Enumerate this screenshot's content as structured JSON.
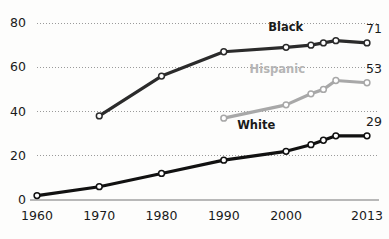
{
  "chart_data": {
    "type": "line",
    "title": "",
    "subtitle": "",
    "xlabel": "",
    "ylabel": "",
    "xlim": [
      1960,
      2013
    ],
    "ylim": [
      0,
      80
    ],
    "grid": true,
    "grid_axis": "y",
    "legend_position": "inline-series-labels",
    "x_ticks": [
      "1960",
      "1970",
      "1980",
      "1990",
      "2000",
      "2013"
    ],
    "x_tick_values": [
      1960,
      1970,
      1980,
      1990,
      2000,
      2013
    ],
    "y_ticks": [
      "0",
      "20",
      "40",
      "60",
      "80"
    ],
    "y_tick_values": [
      0,
      20,
      40,
      60,
      80
    ],
    "series": [
      {
        "name": "Black",
        "color": "#2b2b2b",
        "label_color": "#1a1a1a",
        "end_label": "71",
        "end_value": 71,
        "points": [
          {
            "x": 1970,
            "y": 38
          },
          {
            "x": 1980,
            "y": 56
          },
          {
            "x": 1990,
            "y": 67
          },
          {
            "x": 2000,
            "y": 69
          },
          {
            "x": 2004,
            "y": 70
          },
          {
            "x": 2006,
            "y": 71
          },
          {
            "x": 2008,
            "y": 72
          },
          {
            "x": 2013,
            "y": 71
          }
        ]
      },
      {
        "name": "Hispanic",
        "color": "#a8a8a8",
        "label_color": "#b3b3b3",
        "end_label": "53",
        "end_value": 53,
        "points": [
          {
            "x": 1990,
            "y": 37
          },
          {
            "x": 2000,
            "y": 43
          },
          {
            "x": 2004,
            "y": 48
          },
          {
            "x": 2006,
            "y": 50
          },
          {
            "x": 2008,
            "y": 54
          },
          {
            "x": 2013,
            "y": 53
          }
        ]
      },
      {
        "name": "White",
        "color": "#111111",
        "label_color": "#1a1a1a",
        "end_label": "29",
        "end_value": 29,
        "points": [
          {
            "x": 1960,
            "y": 2
          },
          {
            "x": 1970,
            "y": 6
          },
          {
            "x": 1980,
            "y": 12
          },
          {
            "x": 1990,
            "y": 18
          },
          {
            "x": 2000,
            "y": 22
          },
          {
            "x": 2004,
            "y": 25
          },
          {
            "x": 2006,
            "y": 27
          },
          {
            "x": 2008,
            "y": 29
          },
          {
            "x": 2013,
            "y": 29
          }
        ]
      }
    ],
    "series_labels": [
      {
        "name": "Black",
        "text": "Black",
        "x": 2001,
        "y": 78,
        "color": "#1a1a1a"
      },
      {
        "name": "Hispanic",
        "text": "Hispanic",
        "x": 1998,
        "y": 59,
        "color": "#b5b5b5"
      },
      {
        "name": "White",
        "text": "White",
        "x": 1996,
        "y": 34,
        "color": "#1a1a1a"
      }
    ],
    "axis_color": "#b8b8b8",
    "grid_color": "#9a9a9a",
    "background": "#fdfdfc"
  }
}
